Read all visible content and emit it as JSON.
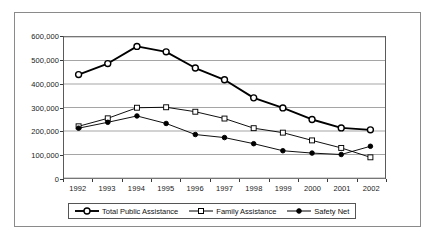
{
  "chart_data": {
    "type": "line",
    "title": "",
    "xlabel": "",
    "ylabel": "",
    "categories": [
      "1992",
      "1993",
      "1994",
      "1995",
      "1996",
      "1997",
      "1998",
      "1999",
      "2000",
      "2001",
      "2002"
    ],
    "ylim": [
      0,
      600000
    ],
    "ytick_labels": [
      "0",
      "100,000",
      "200,000",
      "300,000",
      "400,000",
      "500,000",
      "600,000"
    ],
    "ytick_values": [
      0,
      100000,
      200000,
      300000,
      400000,
      500000,
      600000
    ],
    "grid": true,
    "legend_position": "bottom",
    "series": [
      {
        "name": "Total Public Assistance",
        "marker": "open-circle",
        "values": [
          440000,
          487000,
          560000,
          537000,
          468000,
          418000,
          341000,
          298000,
          249000,
          213000,
          205000
        ]
      },
      {
        "name": "Family Assistance",
        "marker": "open-square",
        "values": [
          220000,
          254000,
          299000,
          301000,
          282000,
          253000,
          212000,
          193000,
          160000,
          128000,
          88000
        ]
      },
      {
        "name": "Safety Net",
        "marker": "filled-circle",
        "values": [
          212000,
          237000,
          264000,
          232000,
          185000,
          172000,
          146000,
          116000,
          106000,
          100000,
          135000
        ]
      }
    ]
  },
  "axis": {
    "y_labels": [
      "600,000",
      "500,000",
      "400,000",
      "300,000",
      "200,000",
      "100,000",
      "0"
    ],
    "x_labels": [
      "1992",
      "1993",
      "1994",
      "1995",
      "1996",
      "1997",
      "1998",
      "1999",
      "2000",
      "2001",
      "2002"
    ]
  },
  "legend": {
    "entries": [
      {
        "label": "Total Public Assistance",
        "marker": "open-circle-marker-icon"
      },
      {
        "label": "Family Assistance",
        "marker": "open-square-marker-icon"
      },
      {
        "label": "Safety Net",
        "marker": "filled-circle-marker-icon"
      }
    ]
  }
}
